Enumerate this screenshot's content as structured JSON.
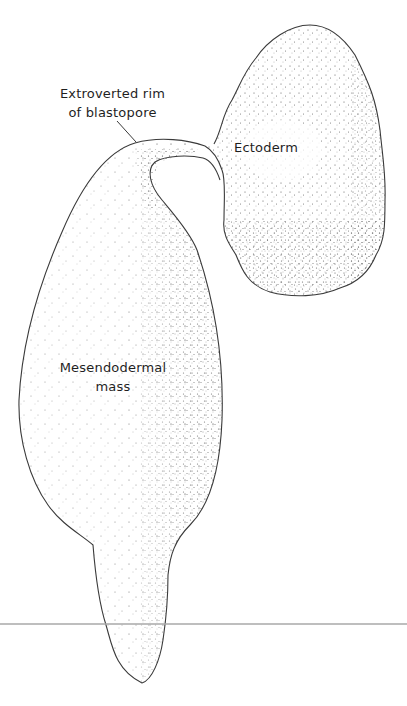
{
  "figure": {
    "type": "embryo diagram (exogastrula)",
    "labels": {
      "rim": [
        "Extroverted rim",
        "of blastopore"
      ],
      "ectoderm": "Ectoderm",
      "mesendoderm": [
        "Mesendodermal",
        "mass"
      ]
    },
    "structures": [
      {
        "name": "Ectoderm",
        "shape": "lobed stippled sac, upper right"
      },
      {
        "name": "Mesendodermal mass",
        "shape": "elongated stippled sac tapering downward, left"
      },
      {
        "name": "Extroverted rim of blastopore",
        "shape": "narrow neck connecting the two masses"
      }
    ],
    "colors": {
      "outline": "#3a3a3a",
      "stipple": "#4a4a4a",
      "baseline": "#a8a8a8",
      "background": "#ffffff",
      "text": "#1f1f1f"
    }
  }
}
